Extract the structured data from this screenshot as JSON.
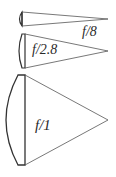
{
  "diagram": {
    "title": "",
    "cones": [
      {
        "label": "f/8",
        "aperture": "f/8"
      },
      {
        "label": "f/2.8",
        "aperture": "f/2.8"
      },
      {
        "label": "f/1",
        "aperture": "f/1"
      }
    ],
    "colors": {
      "stroke": "#333333",
      "background": "#ffffff"
    }
  }
}
